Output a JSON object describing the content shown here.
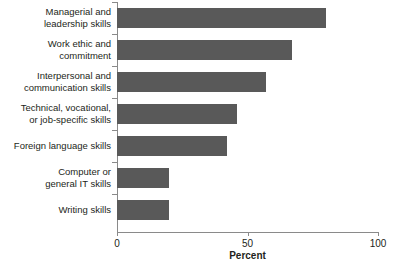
{
  "chart_data": {
    "type": "bar",
    "orientation": "horizontal",
    "title": "",
    "xlabel": "Percent",
    "ylabel": "",
    "xlim": [
      0,
      100
    ],
    "xticks": [
      0,
      50,
      100
    ],
    "xtick_labels": [
      "0",
      "50",
      "100"
    ],
    "grid": false,
    "legend": false,
    "bar_color": "#595959",
    "axis_color": "#8a8a8a",
    "background_color": "#ffffff",
    "categories": [
      "Managerial and leadership skills",
      "Work ethic and commitment",
      "Interpersonal and communication skills",
      "Technical, vocational, or job-specific skills",
      "Foreign language skills",
      "Computer or general IT skills",
      "Writing skills"
    ],
    "category_label_lines": [
      [
        "Managerial and",
        "leadership skills"
      ],
      [
        "Work ethic and",
        "commitment"
      ],
      [
        "Interpersonal and",
        "communication skills"
      ],
      [
        "Technical, vocational,",
        "or job-specific skills"
      ],
      [
        "Foreign language skills"
      ],
      [
        "Computer or",
        "general IT skills"
      ],
      [
        "Writing skills"
      ]
    ],
    "values": [
      80,
      67,
      57,
      46,
      42,
      20,
      20
    ]
  }
}
